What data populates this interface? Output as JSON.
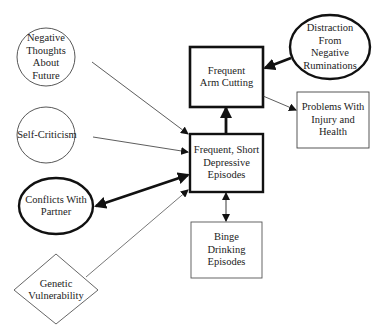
{
  "nodes": {
    "negative_thoughts": {
      "label": "Negative\nThoughts\nAbout\nFuture",
      "shape": "ellipse",
      "emphasis": "normal"
    },
    "self_criticism": {
      "label": "Self-Criticism",
      "shape": "ellipse",
      "emphasis": "normal"
    },
    "conflicts_partner": {
      "label": "Conflicts With\nPartner",
      "shape": "ellipse",
      "emphasis": "bold"
    },
    "genetic_vulnerability": {
      "label": "Genetic\nVulnerability",
      "shape": "diamond",
      "emphasis": "normal"
    },
    "arm_cutting": {
      "label": "Frequent\nArm Cutting",
      "shape": "rectangle",
      "emphasis": "bold"
    },
    "depressive_episodes": {
      "label": "Frequent, Short\nDepressive\nEpisodes",
      "shape": "rectangle",
      "emphasis": "bold"
    },
    "distraction": {
      "label": "Distraction\nFrom\nNegative\nRuminations",
      "shape": "ellipse",
      "emphasis": "bold"
    },
    "problems_injury": {
      "label": "Problems With\nInjury and\nHealth",
      "shape": "rectangle",
      "emphasis": "normal"
    },
    "binge_drinking": {
      "label": "Binge\nDrinking\nEpisodes",
      "shape": "rectangle",
      "emphasis": "normal"
    }
  },
  "edges": [
    {
      "from": "negative_thoughts",
      "to": "depressive_episodes",
      "style": "thin",
      "direction": "forward"
    },
    {
      "from": "self_criticism",
      "to": "depressive_episodes",
      "style": "thin",
      "direction": "forward"
    },
    {
      "from": "conflicts_partner",
      "to": "depressive_episodes",
      "style": "bold",
      "direction": "both"
    },
    {
      "from": "genetic_vulnerability",
      "to": "depressive_episodes",
      "style": "thin",
      "direction": "forward"
    },
    {
      "from": "depressive_episodes",
      "to": "arm_cutting",
      "style": "bold",
      "direction": "forward"
    },
    {
      "from": "distraction",
      "to": "arm_cutting",
      "style": "bold",
      "direction": "forward"
    },
    {
      "from": "arm_cutting",
      "to": "problems_injury",
      "style": "thin",
      "direction": "forward"
    },
    {
      "from": "depressive_episodes",
      "to": "binge_drinking",
      "style": "thin",
      "direction": "both"
    }
  ]
}
